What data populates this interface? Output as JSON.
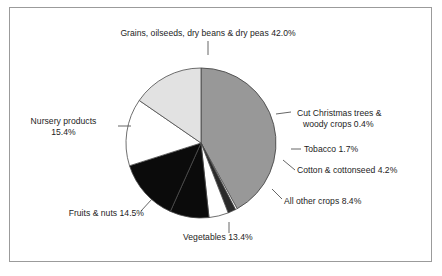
{
  "figure": {
    "border_color": "#9b9b9b",
    "background": "#ffffff"
  },
  "chart_data": {
    "type": "pie",
    "title": "",
    "subtitle": "",
    "xlabel": "",
    "ylabel": "",
    "legend_position": "none",
    "grid": false,
    "start_angle_deg": 0,
    "direction": "clockwise",
    "units": "percent",
    "total": 100.0,
    "categories": [
      "Grains, oilseeds, dry beans & dry peas",
      "Cut Christmas trees & woody crops",
      "Tobacco",
      "Cotton & cottonseed",
      "All other crops",
      "Vegetables",
      "Fruits & nuts",
      "Nursery products"
    ],
    "values": [
      42.0,
      0.4,
      1.7,
      4.2,
      8.4,
      13.4,
      14.5,
      15.4
    ],
    "colors": [
      "#989898",
      "#ffffff",
      "#2a2a2a",
      "#ffffff",
      "#0b0b0b",
      "#0b0b0b",
      "#ffffff",
      "#e2e2e2"
    ],
    "slice_edge_color": "#4a4a4a",
    "slices": [
      {
        "label": "Grains, oilseeds, dry beans & dry peas",
        "value": 42.0,
        "value_text": "42.0%",
        "color": "#989898"
      },
      {
        "label": "Cut Christmas trees & woody crops",
        "value": 0.4,
        "value_text": "0.4%",
        "color": "#ffffff"
      },
      {
        "label": "Tobacco",
        "value": 1.7,
        "value_text": "1.7%",
        "color": "#2a2a2a"
      },
      {
        "label": "Cotton & cottonseed",
        "value": 4.2,
        "value_text": "4.2%",
        "color": "#ffffff"
      },
      {
        "label": "All other crops",
        "value": 8.4,
        "value_text": "8.4%",
        "color": "#0b0b0b"
      },
      {
        "label": "Vegetables",
        "value": 13.4,
        "value_text": "13.4%",
        "color": "#0b0b0b"
      },
      {
        "label": "Fruits & nuts",
        "value": 14.5,
        "value_text": "14.5%",
        "color": "#ffffff"
      },
      {
        "label": "Nursery products",
        "value": 15.4,
        "value_text": "15.4%",
        "color": "#e2e2e2"
      }
    ]
  },
  "labels": {
    "grains": "Grains, oilseeds, dry beans & dry peas 42.0%",
    "christmas_line1": "Cut Christmas trees &",
    "christmas_line2": "woody crops 0.4%",
    "tobacco": "Tobacco 1.7%",
    "cotton": "Cotton & cottonseed 4.2%",
    "all_other": "All other crops 8.4%",
    "vegetables": "Vegetables 13.4%",
    "fruits": "Fruits & nuts 14.5%",
    "nursery_line1": "Nursery products",
    "nursery_line2": "15.4%"
  }
}
